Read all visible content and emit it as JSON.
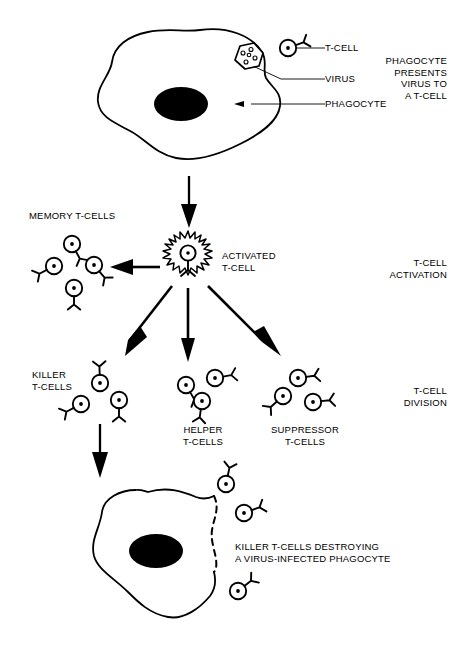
{
  "diagram": {
    "background_color": "#ffffff",
    "ink_color": "#000000"
  },
  "stage_labels": {
    "stage1": "PHAGOCYTE\nPRESENTS\nVIRUS TO\nA T-CELL",
    "stage2": "T-CELL\nACTIVATION",
    "stage3": "T-CELL\nDIVISION"
  },
  "callouts": {
    "t_cell": "T-CELL",
    "virus": "VIRUS",
    "phagocyte": "PHAGOCYTE"
  },
  "group_labels": {
    "memory": "MEMORY T-CELLS",
    "activated": "ACTIVATED\nT-CELL",
    "killer": "KILLER\nT-CELLS",
    "helper": "HELPER\nT-CELLS",
    "suppressor": "SUPPRESSOR\nT-CELLS"
  },
  "caption": {
    "bottom": "KILLER T-CELLS DESTROYING\nA VIRUS-INFECTED PHAGOCYTE"
  },
  "icons": {
    "t_cell": "t-cell-icon",
    "activated_t_cell": "activated-t-cell-icon",
    "virus": "virus-hexagon-icon",
    "phagocyte": "phagocyte-cell-icon",
    "nucleus": "nucleus-icon",
    "arrow": "arrow-icon",
    "lysis": "dashed-membrane-icon"
  },
  "counts": {
    "memory_t_cells": 4,
    "killer_t_cells_group": 3,
    "helper_t_cells": 3,
    "suppressor_t_cells": 3,
    "attacking_killer_t_cells": 3,
    "virus_particles": 5
  }
}
